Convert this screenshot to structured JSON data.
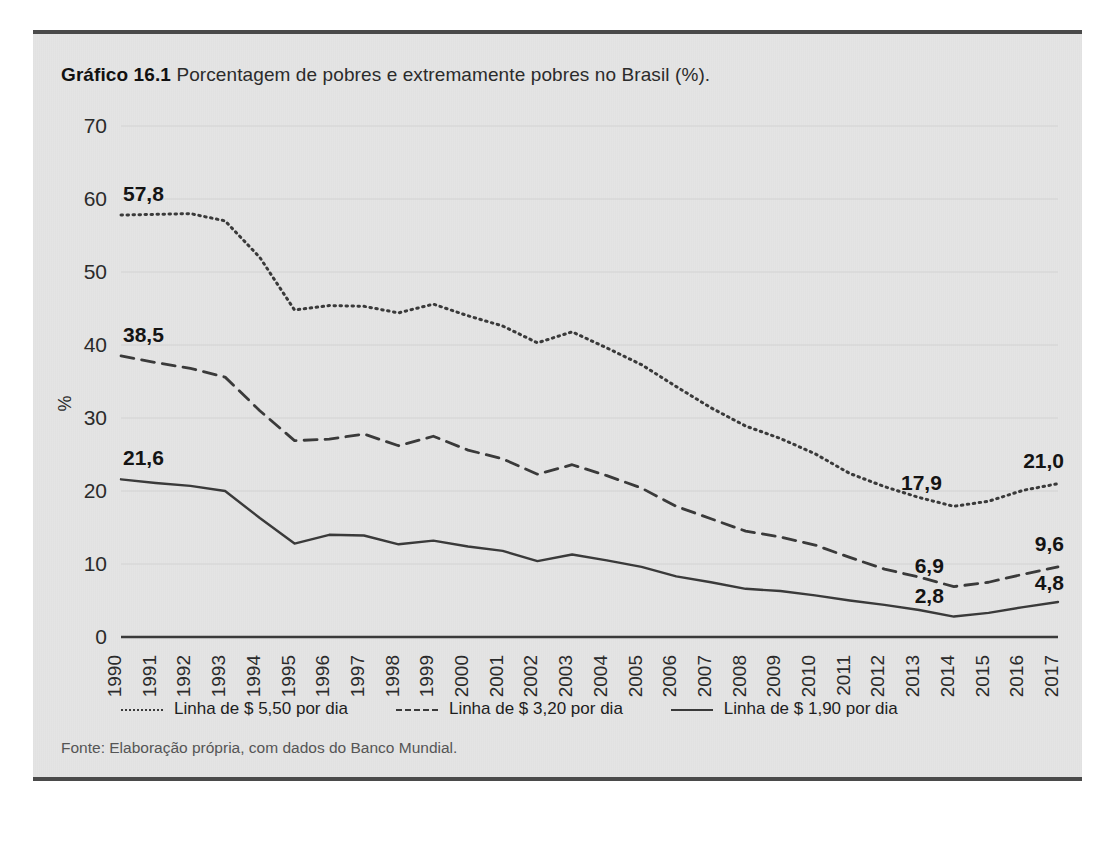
{
  "figure": {
    "label": "Gráfico 16.1",
    "caption": "Porcentagem de pobres e extremamente pobres no Brasil (%).",
    "source": "Fonte: Elaboração própria, com dados do Banco Mundial."
  },
  "legend": [
    {
      "style": "dotted",
      "label": "Linha de $ 5,50 por dia"
    },
    {
      "style": "dashed",
      "label": "Linha de $ 3,20 por dia"
    },
    {
      "style": "solid",
      "label": "Linha de $ 1,90 por dia"
    }
  ],
  "annotations": {
    "start_5_50": "57,8",
    "start_3_20": "38,5",
    "start_1_90": "21,6",
    "min_5_50": "17,9",
    "min_3_20": "6,9",
    "min_1_90": "2,8",
    "end_5_50": "21,0",
    "end_3_20": "9,6",
    "end_1_90": "4,8"
  },
  "colors": {
    "panel_background": "#e4e4e4",
    "panel_rule": "#4a4a4a",
    "line": "#3a3a3a",
    "axis": "#3a3a3a",
    "gridline": "#d2d2d2",
    "text": "#2b2b2b"
  },
  "chart_data": {
    "type": "line",
    "title": "Porcentagem de pobres e extremamente pobres no Brasil (%)",
    "xlabel": "",
    "ylabel": "%",
    "ylim": [
      0,
      70
    ],
    "yticks": [
      0,
      10,
      20,
      30,
      40,
      50,
      60,
      70
    ],
    "grid": true,
    "legend_position": "bottom",
    "x": [
      1990,
      1991,
      1992,
      1993,
      1994,
      1995,
      1996,
      1997,
      1998,
      1999,
      2000,
      2001,
      2002,
      2003,
      2004,
      2005,
      2006,
      2007,
      2008,
      2009,
      2010,
      2011,
      2012,
      2013,
      2014,
      2015,
      2016,
      2017
    ],
    "categories": [
      "1990",
      "1991",
      "1992",
      "1993",
      "1994",
      "1995",
      "1996",
      "1997",
      "1998",
      "1999",
      "2000",
      "2001",
      "2002",
      "2003",
      "2004",
      "2005",
      "2006",
      "2007",
      "2008",
      "2009",
      "2010",
      "2011",
      "2012",
      "2013",
      "2014",
      "2015",
      "2016",
      "2017"
    ],
    "series": [
      {
        "name": "Linha de $ 5,50 por dia",
        "style": "dotted",
        "values": [
          57.8,
          57.9,
          58.0,
          57.0,
          52.0,
          44.8,
          45.4,
          45.3,
          44.4,
          45.6,
          44.0,
          42.6,
          40.3,
          41.8,
          39.6,
          37.3,
          34.3,
          31.4,
          28.9,
          27.2,
          25.1,
          22.4,
          20.6,
          19.1,
          17.9,
          18.6,
          20.1,
          21.0
        ]
      },
      {
        "name": "Linha de $ 3,20 por dia",
        "style": "dashed",
        "values": [
          38.5,
          37.6,
          36.8,
          35.6,
          31.0,
          26.9,
          27.1,
          27.8,
          26.2,
          27.5,
          25.6,
          24.4,
          22.3,
          23.6,
          22.1,
          20.4,
          17.9,
          16.2,
          14.5,
          13.7,
          12.6,
          10.9,
          9.3,
          8.2,
          6.9,
          7.5,
          8.6,
          9.6
        ]
      },
      {
        "name": "Linha de $ 1,90 por dia",
        "style": "solid",
        "values": [
          21.6,
          21.1,
          20.7,
          20.0,
          16.3,
          12.8,
          14.0,
          13.9,
          12.7,
          13.2,
          12.4,
          11.8,
          10.4,
          11.3,
          10.5,
          9.6,
          8.3,
          7.5,
          6.6,
          6.3,
          5.7,
          5.0,
          4.4,
          3.7,
          2.8,
          3.3,
          4.1,
          4.8
        ]
      }
    ]
  }
}
